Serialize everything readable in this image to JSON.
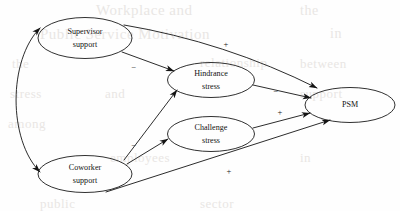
{
  "figure": {
    "type": "path-model-diagram",
    "width": 400,
    "height": 211,
    "background_color": "#fefefe",
    "stroke_color": "#141414"
  },
  "nodes": [
    {
      "id": "supervisor-support",
      "line1": "Supervisor",
      "line2": "support",
      "cx": 85,
      "cy": 38,
      "rx": 47,
      "ry": 20.5
    },
    {
      "id": "hindrance-stress",
      "line1": "Hindrance",
      "line2": "stress",
      "cx": 211,
      "cy": 80,
      "rx": 43.5,
      "ry": 17.5
    },
    {
      "id": "challenge-stress",
      "line1": "Challenge",
      "line2": "stress",
      "cx": 211,
      "cy": 134,
      "rx": 43.5,
      "ry": 17.5
    },
    {
      "id": "coworker-support",
      "line1": "Coworker",
      "line2": "support",
      "cx": 85,
      "cy": 174,
      "rx": 47,
      "ry": 18.5
    },
    {
      "id": "psm",
      "line1": "PSM",
      "line2": "",
      "cx": 350,
      "cy": 105,
      "rx": 45,
      "ry": 17.5
    }
  ],
  "edges": [
    {
      "id": "supervisor-to-psm",
      "from": "supervisor-support",
      "to": "psm",
      "sign": "+",
      "sign_x": 226,
      "sign_y": 45
    },
    {
      "id": "supervisor-to-hindrance",
      "from": "supervisor-support",
      "to": "hindrance-stress",
      "sign": "−",
      "sign_x": 134,
      "sign_y": 68
    },
    {
      "id": "hindrance-to-psm",
      "from": "hindrance-stress",
      "to": "psm",
      "sign": "−",
      "sign_x": 276,
      "sign_y": 92
    },
    {
      "id": "challenge-to-psm",
      "from": "challenge-stress",
      "to": "psm",
      "sign": "+",
      "sign_x": 280,
      "sign_y": 113
    },
    {
      "id": "coworker-to-hindrance",
      "from": "coworker-support",
      "to": "hindrance-stress",
      "sign": "−",
      "sign_x": 134,
      "sign_y": 146
    },
    {
      "id": "coworker-to-challenge",
      "from": "coworker-support",
      "to": "challenge-stress",
      "sign": "",
      "sign_x": 0,
      "sign_y": 0
    },
    {
      "id": "coworker-to-psm",
      "from": "coworker-support",
      "to": "psm",
      "sign": "+",
      "sign_x": 229,
      "sign_y": 172
    },
    {
      "id": "supervisor-coworker-correlation",
      "from": "supervisor-support",
      "to": "coworker-support",
      "sign": "",
      "bidirectional": true,
      "sign_x": 0,
      "sign_y": 0
    }
  ],
  "background_ghost_text": [
    {
      "text": "Workplace and",
      "x": 96,
      "y": 2,
      "size": 15
    },
    {
      "text": "the",
      "x": 300,
      "y": 3,
      "size": 14
    },
    {
      "text": "Public Service Motivation",
      "x": 40,
      "y": 26,
      "size": 15
    },
    {
      "text": "in",
      "x": 330,
      "y": 26,
      "size": 14
    },
    {
      "text": "the",
      "x": 12,
      "y": 56,
      "size": 13
    },
    {
      "text": "relationship",
      "x": 200,
      "y": 55,
      "size": 13
    },
    {
      "text": "between",
      "x": 300,
      "y": 56,
      "size": 13
    },
    {
      "text": "stress",
      "x": 10,
      "y": 86,
      "size": 13
    },
    {
      "text": "and",
      "x": 105,
      "y": 86,
      "size": 13
    },
    {
      "text": "support",
      "x": 300,
      "y": 86,
      "size": 13
    },
    {
      "text": "among",
      "x": 8,
      "y": 116,
      "size": 13
    },
    {
      "text": "employees",
      "x": 110,
      "y": 150,
      "size": 13
    },
    {
      "text": "in",
      "x": 300,
      "y": 150,
      "size": 13
    },
    {
      "text": "public",
      "x": 40,
      "y": 196,
      "size": 13
    },
    {
      "text": "sector",
      "x": 200,
      "y": 196,
      "size": 13
    }
  ]
}
